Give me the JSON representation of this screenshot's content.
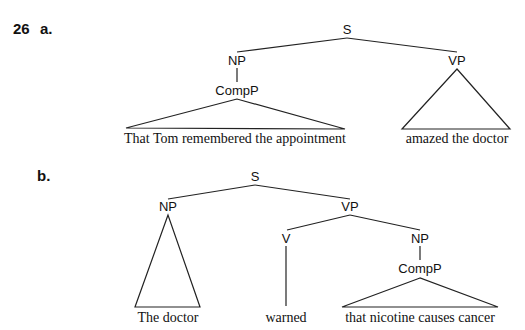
{
  "example": {
    "number": "26",
    "a_label": "a.",
    "b_label": "b."
  },
  "tree_a": {
    "nodes": {
      "S": "S",
      "NP": "NP",
      "CompP": "CompP",
      "VP": "VP"
    },
    "leaves": {
      "subject": "That Tom remembered the appointment",
      "predicate": "amazed the doctor"
    }
  },
  "tree_b": {
    "nodes": {
      "S": "S",
      "NP": "NP",
      "VP": "VP",
      "V": "V",
      "NP2": "NP",
      "CompP": "CompP"
    },
    "leaves": {
      "subject": "The doctor",
      "verb": "warned",
      "object": "that nicotine causes cancer"
    }
  }
}
